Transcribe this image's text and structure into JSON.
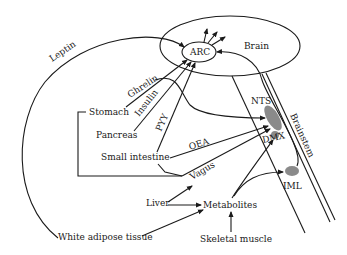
{
  "diagram": {
    "brain": {
      "label": "Brain"
    },
    "arc": {
      "label": "ARC"
    },
    "brainstem": {
      "label": "Brainstem"
    },
    "nuclei": {
      "nts": "NTS",
      "dmx": "DMX",
      "iml": "IML"
    },
    "organs": {
      "stomach": "Stomach",
      "pancreas": "Pancreas",
      "small_intestine": "Small intestine",
      "liver": "Liver",
      "white_adipose": "White adipose tissue",
      "skeletal_muscle": "Skeletal muscle",
      "metabolites": "Metabolites"
    },
    "signals": {
      "leptin": "Leptin",
      "ghrelin": "Ghrelin",
      "insulin": "Insulin",
      "pyy": "PYY",
      "oea": "OEA",
      "vagus": "Vagus"
    },
    "colors": {
      "line": "#1a1a1a",
      "nucleus_fill": "#8a8a8a",
      "background": "#ffffff"
    }
  }
}
